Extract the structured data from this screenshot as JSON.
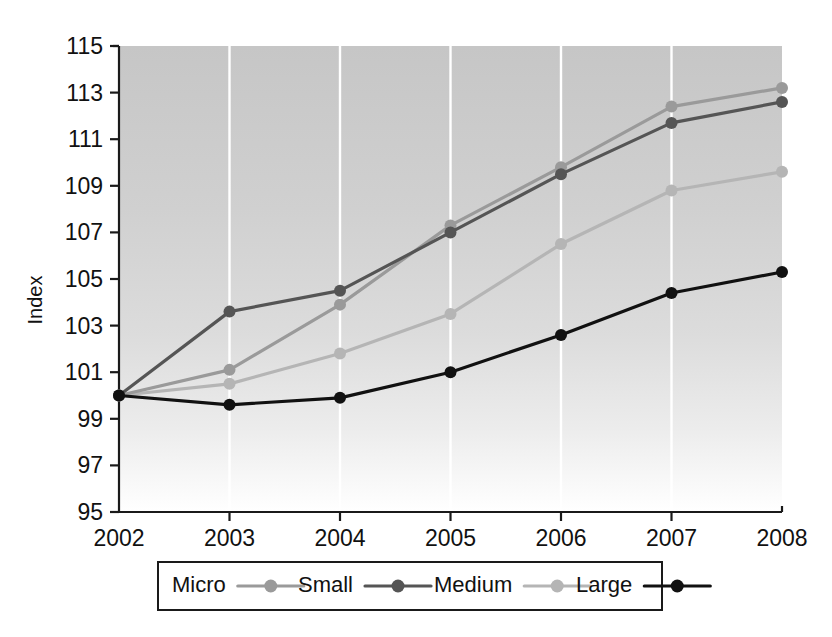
{
  "chart_data": {
    "type": "line",
    "title": "",
    "xlabel": "",
    "ylabel": "Index",
    "x": [
      2002,
      2003,
      2004,
      2005,
      2006,
      2007,
      2008
    ],
    "xtick_labels": [
      "2002",
      "2003",
      "2004",
      "2005",
      "2006",
      "2007",
      "2008"
    ],
    "xlim": [
      2002,
      2008
    ],
    "ylim": [
      95,
      115
    ],
    "ytick_labels": [
      "95",
      "97",
      "99",
      "101",
      "103",
      "105",
      "107",
      "109",
      "111",
      "113",
      "115"
    ],
    "yticks": [
      95,
      97,
      99,
      101,
      103,
      105,
      107,
      109,
      111,
      113,
      115
    ],
    "grid": "vertical-white-gridlines",
    "legend_position": "bottom",
    "plot_background": "vertical gradient grey to white",
    "series": [
      {
        "name": "Micro",
        "color": "#9a9a9a",
        "marker": "circle",
        "values": [
          100,
          101.1,
          103.9,
          107.3,
          109.8,
          112.4,
          113.2
        ]
      },
      {
        "name": "Small",
        "color": "#555555",
        "marker": "circle",
        "values": [
          100,
          103.6,
          104.5,
          107.0,
          109.5,
          111.7,
          112.6
        ]
      },
      {
        "name": "Medium",
        "color": "#b5b5b5",
        "marker": "circle",
        "values": [
          100,
          100.5,
          101.8,
          103.5,
          106.5,
          108.8,
          109.6
        ]
      },
      {
        "name": "Large",
        "color": "#111111",
        "marker": "circle",
        "values": [
          100,
          99.6,
          99.9,
          101.0,
          102.6,
          104.4,
          105.3
        ]
      }
    ]
  },
  "legend": {
    "entries": [
      {
        "label": "Micro",
        "color": "#9a9a9a"
      },
      {
        "label": "Small",
        "color": "#555555"
      },
      {
        "label": "Medium",
        "color": "#b5b5b5"
      },
      {
        "label": "Large",
        "color": "#111111"
      }
    ]
  },
  "axes": {
    "y_title": "Index"
  }
}
